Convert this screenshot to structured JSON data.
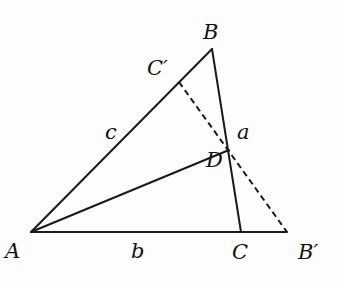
{
  "diagram": {
    "title": "",
    "points": {
      "A": {
        "label": "A",
        "x": 31,
        "y": 232
      },
      "B": {
        "label": "B",
        "x": 212,
        "y": 49
      },
      "C": {
        "label": "C",
        "x": 241,
        "y": 232
      },
      "B_prime": {
        "label": "B′",
        "x": 287,
        "y": 232
      },
      "C_prime": {
        "label": "C′",
        "x": 179,
        "y": 82
      },
      "D": {
        "label": "D",
        "x": 229,
        "y": 150
      }
    },
    "side_labels": {
      "a": "a",
      "b": "b",
      "c": "c"
    },
    "segments": [
      {
        "from": "A",
        "to": "B",
        "style": "solid"
      },
      {
        "from": "B",
        "to": "C",
        "style": "solid"
      },
      {
        "from": "A",
        "to": "B_prime",
        "style": "solid"
      },
      {
        "from": "A",
        "to": "D",
        "style": "solid"
      },
      {
        "from": "C_prime",
        "to": "B_prime",
        "style": "dashed"
      }
    ],
    "colors": {
      "stroke": "#1a1a1a",
      "background": "#fdfdfd"
    }
  }
}
